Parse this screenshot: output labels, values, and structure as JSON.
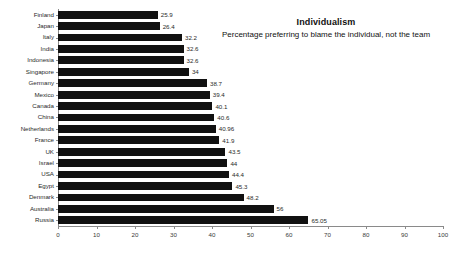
{
  "chart_data": {
    "type": "bar",
    "orientation": "horizontal",
    "title": "Individualism",
    "subtitle": "Percentage preferring to blame the individual, not the team",
    "xlabel": "",
    "ylabel": "",
    "xlim": [
      0,
      100
    ],
    "xticks": [
      0,
      10,
      20,
      30,
      40,
      50,
      60,
      70,
      80,
      90,
      100
    ],
    "grid": false,
    "legend": false,
    "bar_color": "#111111",
    "axis_color": "#8a8a8a",
    "categories": [
      "Finland",
      "Japan",
      "Italy",
      "India",
      "Indonesia",
      "Singapore",
      "Germany",
      "Mexico",
      "Canada",
      "China",
      "Netherlands",
      "France",
      "UK",
      "Israel",
      "USA",
      "Egypt",
      "Denmark",
      "Australia",
      "Russia"
    ],
    "values": [
      25.9,
      26.4,
      32.2,
      32.6,
      32.6,
      34,
      38.7,
      39.4,
      40.1,
      40.6,
      40.96,
      41.9,
      43.5,
      44,
      44.4,
      45.3,
      48.2,
      56,
      65.05
    ],
    "value_labels": [
      "25.9",
      "26.4",
      "32.2",
      "32.6",
      "32.6",
      "34",
      "38.7",
      "39.4",
      "40.1",
      "40.6",
      "40.96",
      "41.9",
      "43.5",
      "44",
      "44.4",
      "45.3",
      "48.2",
      "56",
      "65.05"
    ]
  }
}
